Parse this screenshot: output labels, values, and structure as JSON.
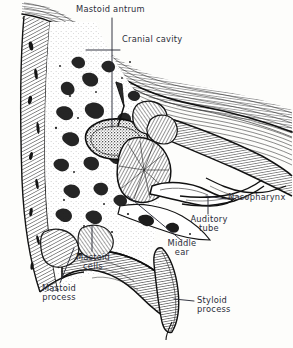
{
  "figure": {
    "background_color": "#fdfdfb",
    "ink_color": "#1a1a1a",
    "label_color": "#2b2d3a",
    "style": "pen-and-ink hatched anatomical engraving"
  },
  "labels": [
    {
      "id": "mastoid-antrum",
      "text": "Mastoid antrum",
      "x": 76,
      "y": 6,
      "align": "left",
      "leader": {
        "from": [
          112,
          18
        ],
        "to": [
          112,
          128
        ],
        "type": "line"
      }
    },
    {
      "id": "cranial-cavity",
      "text": "Cranial cavity",
      "x": 122,
      "y": 36,
      "align": "left",
      "leader": {
        "from": [
          120,
          50
        ],
        "to": [
          86,
          50
        ],
        "type": "line"
      }
    },
    {
      "id": "nasopharynx",
      "text": "Nasopharynx",
      "x": 228,
      "y": 194,
      "align": "left",
      "leader": {
        "from": [
          226,
          199
        ],
        "to": [
          208,
          196
        ],
        "type": "line"
      }
    },
    {
      "id": "auditory-tube",
      "text": "Auditory\ntube",
      "x": 208,
      "y": 216,
      "align": "center",
      "leader": {
        "from": [
          208,
          214
        ],
        "to": [
          208,
          196
        ],
        "type": "line"
      }
    },
    {
      "id": "middle-ear",
      "text": "Middle\near",
      "x": 183,
      "y": 240,
      "align": "center",
      "leader": {
        "from": [
          181,
          243
        ],
        "to": [
          128,
          196
        ],
        "type": "line"
      }
    },
    {
      "id": "mastoid-cells",
      "text": "Mastoid\ncells",
      "x": 72,
      "y": 254,
      "align": "center",
      "leader": {
        "from": [
          92,
          252
        ],
        "to": [
          92,
          226
        ],
        "type": "line"
      }
    },
    {
      "id": "mastoid-process",
      "text": "Mastoid\nprocess",
      "x": 39,
      "y": 285,
      "align": "center",
      "leader": {
        "from": [
          60,
          283
        ],
        "to": [
          73,
          247
        ],
        "type": "line"
      }
    },
    {
      "id": "styloid-process",
      "text": "Styloid\nprocess",
      "x": 196,
      "y": 297,
      "align": "left",
      "leader": {
        "from": [
          194,
          301
        ],
        "to": [
          176,
          299
        ],
        "type": "line"
      }
    }
  ],
  "structures": [
    {
      "id": "cranial-vault",
      "name": "cranial vault bone",
      "texture": "flowing parallel line hatching"
    },
    {
      "id": "cut-bone-left",
      "name": "cut cancellous bone (left margin)",
      "texture": "diagonal hatching with marrow lacunae"
    },
    {
      "id": "mastoid-air-cells",
      "name": "mastoid air cells",
      "texture": "irregular white cavities in stippled bone"
    },
    {
      "id": "mastoid-antrum-cavity",
      "name": "mastoid antrum",
      "texture": "dark stippled oval cavity"
    },
    {
      "id": "petrous-pyramid",
      "name": "petrous portion / labyrinth",
      "texture": "radiating fan hatching"
    },
    {
      "id": "middle-ear-cavity",
      "name": "tympanic cavity",
      "texture": "open white chamber"
    },
    {
      "id": "auditory-tube-canal",
      "name": "auditory (Eustachian) tube",
      "texture": "tapering duct"
    },
    {
      "id": "nasopharynx-space",
      "name": "nasopharynx",
      "texture": "open space at right"
    },
    {
      "id": "mastoid-process-bone",
      "name": "mastoid process",
      "texture": "dense vertical hatching"
    },
    {
      "id": "styloid-process-bone",
      "name": "styloid process",
      "texture": "curved tapering spine, fine hatching"
    }
  ]
}
